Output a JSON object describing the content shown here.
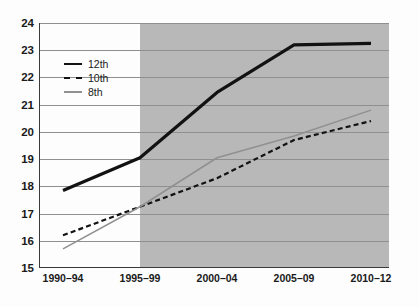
{
  "chart_data": {
    "type": "line",
    "title": "",
    "subtitle": "",
    "xlabel": "",
    "ylabel": "",
    "categories": [
      "1990–94",
      "1995–99",
      "2000–04",
      "2005–09",
      "2010–12"
    ],
    "ylim": [
      15,
      24
    ],
    "yticks": [
      15,
      16,
      17,
      18,
      19,
      20,
      21,
      22,
      23,
      24
    ],
    "ytick_labels": [
      "15",
      "16",
      "17",
      "18",
      "19",
      "20",
      "21",
      "22",
      "23",
      "24"
    ],
    "grid": true,
    "grid_axis": "y",
    "legend_position": "upper-left-inside",
    "series": [
      {
        "name": "12th",
        "style": "solid",
        "width": "thick",
        "color": "#121212",
        "values": [
          17.85,
          19.05,
          21.45,
          23.2,
          23.25
        ]
      },
      {
        "name": "10th",
        "style": "dashed",
        "width": "medium",
        "color": "#121212",
        "values": [
          16.2,
          17.25,
          18.3,
          19.7,
          20.4
        ]
      },
      {
        "name": "8th",
        "style": "solid",
        "width": "thin",
        "color": "#909090",
        "values": [
          15.7,
          17.25,
          19.05,
          19.85,
          20.8
        ]
      }
    ],
    "annotations": [
      {
        "type": "shaded-band",
        "name": "highlighted-period-band",
        "from_category": "1995–99",
        "to_category": "2010–12",
        "color": "#b8b8b8"
      }
    ]
  },
  "legend": {
    "items": [
      {
        "label": "12th"
      },
      {
        "label": "10th"
      },
      {
        "label": "8th"
      }
    ]
  }
}
